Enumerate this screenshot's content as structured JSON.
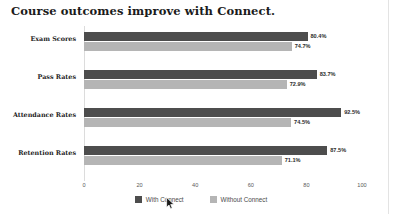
{
  "chart_data": {
    "type": "bar",
    "orientation": "horizontal",
    "title": "Course outcomes improve with Connect.",
    "xlabel": "",
    "ylabel": "",
    "xlim": [
      0,
      100
    ],
    "xticks": [
      "0",
      "20",
      "40",
      "60",
      "80",
      "100"
    ],
    "grid": false,
    "legend_position": "bottom",
    "categories": [
      "Exam Scores",
      "Pass Rates",
      "Attendance Rates",
      "Retention Rates"
    ],
    "series": [
      {
        "name": "With Connect",
        "color": "#4d4d4d",
        "values": [
          80.4,
          83.7,
          92.5,
          87.5
        ],
        "labels": [
          "80.4%",
          "83.7%",
          "92.5%",
          "87.5%"
        ]
      },
      {
        "name": "Without Connect",
        "color": "#b5b5b5",
        "values": [
          74.7,
          72.9,
          74.5,
          71.1
        ],
        "labels": [
          "74.7%",
          "72.9%",
          "74.5%",
          "71.1%"
        ]
      }
    ]
  },
  "legend": {
    "items": [
      {
        "label": "With Connect",
        "color": "#4d4d4d"
      },
      {
        "label": "Without Connect",
        "color": "#b5b5b5"
      }
    ]
  },
  "cursor": {
    "icon": "mouse-pointer-icon"
  }
}
